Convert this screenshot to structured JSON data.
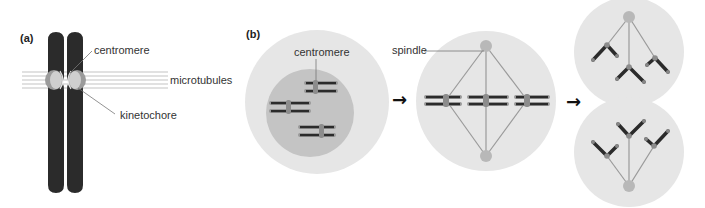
{
  "panels": {
    "a": {
      "label": "(a)",
      "labels": {
        "centromere": "centromere",
        "microtubules": "microtubules",
        "kinetochore": "kinetochore"
      }
    },
    "b": {
      "label": "(b)",
      "labels": {
        "centromere": "centromere",
        "spindle": "spindle"
      },
      "stages": [
        "prophase nucleus",
        "metaphase plate",
        "anaphase / telophase (two daughter cells)"
      ]
    }
  },
  "arrows": [
    "→",
    "→"
  ],
  "colors": {
    "chromosome": "#2b2b2b",
    "centromere": "#8c8c8c",
    "cell_outer": "#e6e6e6",
    "nucleus": "#c4c4c4",
    "spindle_line": "#9a9a9a",
    "pole": "#b8b8b8",
    "microtubule": "#bdbdbd"
  }
}
